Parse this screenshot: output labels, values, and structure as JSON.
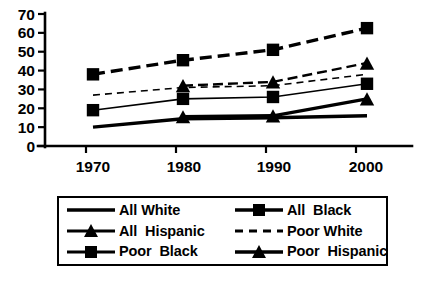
{
  "chart_data": {
    "type": "line",
    "title": "",
    "xlabel": "",
    "ylabel": "",
    "categories": [
      "1970",
      "1980",
      "1990",
      "2000"
    ],
    "x_tick_labels": [
      "1970",
      "1980",
      "1990",
      "2000"
    ],
    "y_tick_labels": [
      "0",
      "10",
      "20",
      "30",
      "40",
      "50",
      "60",
      "70"
    ],
    "y_ticks": [
      0,
      10,
      20,
      30,
      40,
      50,
      60,
      70
    ],
    "ylim": [
      0,
      70
    ],
    "grid": false,
    "legend_position": "bottom",
    "series": [
      {
        "name": "All White",
        "line_style": "solid",
        "line_width": "thick",
        "marker": "none",
        "values": [
          10,
          14.5,
          15,
          16
        ],
        "x": [
          "1970",
          "1980",
          "1990",
          "2000"
        ]
      },
      {
        "name": "All Black",
        "line_style": "dashed",
        "line_width": "thick",
        "marker": "square",
        "values": [
          38,
          45.5,
          51,
          62.5
        ],
        "x": [
          "1970",
          "1980",
          "1990",
          "2000"
        ]
      },
      {
        "name": "All Hispanic",
        "line_style": "dashed",
        "line_width": "medium",
        "marker": "triangle",
        "values": [
          null,
          32,
          34,
          44
        ],
        "x": [
          "1970",
          "1980",
          "1990",
          "2000"
        ]
      },
      {
        "name": "Poor White",
        "line_style": "dashed",
        "line_width": "thin",
        "marker": "none",
        "values": [
          27,
          31,
          32,
          38
        ],
        "x": [
          "1970",
          "1980",
          "1990",
          "2000"
        ]
      },
      {
        "name": "Poor Black",
        "line_style": "solid",
        "line_width": "thin",
        "marker": "square",
        "values": [
          19,
          25,
          26,
          33
        ],
        "x": [
          "1970",
          "1980",
          "1990",
          "2000"
        ]
      },
      {
        "name": "Poor Hispanic",
        "line_style": "solid",
        "line_width": "thick",
        "marker": "triangle",
        "values": [
          null,
          15.5,
          16,
          25
        ],
        "x": [
          "1970",
          "1980",
          "1990",
          "2000"
        ]
      }
    ],
    "colors": {
      "series": "#000000",
      "axis": "#000000",
      "background": "#ffffff"
    }
  },
  "legend": {
    "entries": [
      {
        "label": "All White",
        "sample": "line-solid-thick"
      },
      {
        "label": "All  Black",
        "sample": "line-dashed-thick-square"
      },
      {
        "label": "All  Hispanic",
        "sample": "line-solid-triangle"
      },
      {
        "label": "Poor White",
        "sample": "line-dashed-thin"
      },
      {
        "label": "Poor  Black",
        "sample": "line-solid-square"
      },
      {
        "label": "Poor  Hispanic",
        "sample": "line-solid-triangle"
      }
    ]
  }
}
